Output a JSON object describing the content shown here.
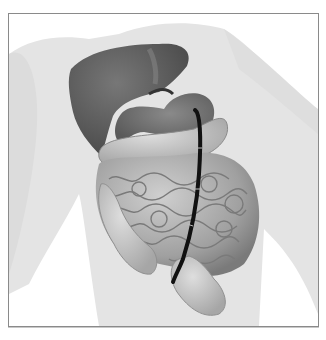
{
  "figure": {
    "parts": [
      "body-silhouette",
      "liver",
      "stomach",
      "small-intestine",
      "large-intestine",
      "rectum",
      "endoscope-tube"
    ],
    "colors": {
      "background": "#ffffff",
      "silhouette": "#e4e4e4",
      "liver": "#5a5a5a",
      "stomach": "#6e6e6e",
      "intestine": "#a8a8a8",
      "intestine_shadow": "#7a7a7a",
      "colon_light": "#c4c4c4",
      "tube": "#111111",
      "frame_border": "#8a8a8a"
    }
  }
}
